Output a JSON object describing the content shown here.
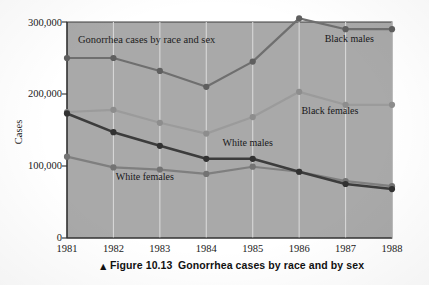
{
  "figure": {
    "caption_marker": "▲",
    "caption_number": "Figure 10.13",
    "caption_text": "Gonorrhea cases by race and by sex"
  },
  "chart_data": {
    "type": "line",
    "title": "Gonorrhea cases by race and sex",
    "xlabel": "",
    "ylabel": "Cases",
    "categories": [
      "1981",
      "1982",
      "1983",
      "1984",
      "1985",
      "1986",
      "1987",
      "1988"
    ],
    "x": [
      1981,
      1982,
      1983,
      1984,
      1985,
      1986,
      1987,
      1988
    ],
    "ylim": [
      0,
      300000
    ],
    "xlim": [
      1981,
      1988
    ],
    "ytick_labels": [
      "0",
      "100,000",
      "200,000",
      "300,000"
    ],
    "ytick_values": [
      0,
      100000,
      200000,
      300000
    ],
    "xtick_labels": [
      "1981",
      "1982",
      "1983",
      "1984",
      "1985",
      "1986",
      "1987",
      "1988"
    ],
    "grid": "vertical",
    "legend_position": "inline-annotations",
    "plot_background": "#a9a9a9",
    "series": [
      {
        "name": "Black males",
        "color": "#6f6f6f",
        "marker_color": "#5f5f5f",
        "label_x": 1986.55,
        "label_y": 272000,
        "values": [
          250000,
          250000,
          232000,
          210000,
          245000,
          305000,
          290000,
          290000
        ]
      },
      {
        "name": "Black females",
        "color": "#9b9b9b",
        "marker_color": "#8d8d8d",
        "label_x": 1986.05,
        "label_y": 172000,
        "values": [
          175000,
          178000,
          160000,
          145000,
          168000,
          203000,
          185000,
          185000
        ]
      },
      {
        "name": "White males",
        "color": "#3c3c3c",
        "marker_color": "#323232",
        "label_x": 1984.35,
        "label_y": 128000,
        "values": [
          173000,
          147000,
          128000,
          110000,
          110000,
          92000,
          75000,
          68000
        ]
      },
      {
        "name": "White females",
        "color": "#7f7f7f",
        "marker_color": "#737373",
        "label_x": 1982.05,
        "label_y": 80000,
        "values": [
          113000,
          98000,
          95000,
          89000,
          99000,
          92000,
          79000,
          72000
        ]
      }
    ]
  }
}
